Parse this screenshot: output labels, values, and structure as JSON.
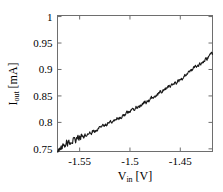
{
  "chart_data": {
    "type": "line",
    "title": "",
    "subtitle": "",
    "xlabel": "V_in [V]",
    "xlabel_base": "V",
    "xlabel_sub": "in",
    "xlabel_unit": "[V]",
    "ylabel": "I_out [mA]",
    "ylabel_base": "I",
    "ylabel_sub": "out",
    "ylabel_unit": "[mA]",
    "xlim": [
      -1.572,
      -1.418
    ],
    "ylim": [
      0.745,
      1.002
    ],
    "xticks": [
      -1.55,
      -1.5,
      -1.45
    ],
    "xtick_labels": [
      "-1.55",
      "-1.5",
      "-1.45"
    ],
    "yticks": [
      0.75,
      0.8,
      0.85,
      0.9,
      0.95,
      1
    ],
    "ytick_labels": [
      "0.75",
      "0.8",
      "0.85",
      "0.9",
      "0.95",
      "1"
    ],
    "grid": false,
    "legend": null,
    "line_color": "#1a1a1a",
    "line_width": 1.1,
    "axis_color": "#6e6e6e",
    "background": "#ffffff",
    "series": [
      {
        "name": "I_out vs V_in",
        "x": [
          -1.572,
          -1.571,
          -1.57,
          -1.569,
          -1.568,
          -1.567,
          -1.566,
          -1.565,
          -1.564,
          -1.563,
          -1.562,
          -1.561,
          -1.56,
          -1.559,
          -1.558,
          -1.557,
          -1.556,
          -1.555,
          -1.554,
          -1.553,
          -1.552,
          -1.551,
          -1.55,
          -1.549,
          -1.548,
          -1.547,
          -1.546,
          -1.545,
          -1.544,
          -1.543,
          -1.542,
          -1.541,
          -1.54,
          -1.539,
          -1.538,
          -1.537,
          -1.536,
          -1.535,
          -1.534,
          -1.533,
          -1.532,
          -1.531,
          -1.53,
          -1.529,
          -1.528,
          -1.527,
          -1.526,
          -1.525,
          -1.524,
          -1.523,
          -1.522,
          -1.521,
          -1.52,
          -1.519,
          -1.518,
          -1.517,
          -1.516,
          -1.515,
          -1.514,
          -1.513,
          -1.512,
          -1.511,
          -1.51,
          -1.509,
          -1.508,
          -1.507,
          -1.506,
          -1.505,
          -1.504,
          -1.503,
          -1.502,
          -1.501,
          -1.5,
          -1.499,
          -1.498,
          -1.497,
          -1.496,
          -1.495,
          -1.494,
          -1.493,
          -1.492,
          -1.491,
          -1.49,
          -1.489,
          -1.488,
          -1.487,
          -1.486,
          -1.485,
          -1.484,
          -1.483,
          -1.482,
          -1.481,
          -1.48,
          -1.479,
          -1.478,
          -1.477,
          -1.476,
          -1.475,
          -1.474,
          -1.473,
          -1.472,
          -1.471,
          -1.47,
          -1.469,
          -1.468,
          -1.467,
          -1.466,
          -1.465,
          -1.464,
          -1.463,
          -1.462,
          -1.461,
          -1.46,
          -1.459,
          -1.458,
          -1.457,
          -1.456,
          -1.455,
          -1.454,
          -1.453,
          -1.452,
          -1.451,
          -1.45,
          -1.449,
          -1.448,
          -1.447,
          -1.446,
          -1.445,
          -1.444,
          -1.443,
          -1.442,
          -1.441,
          -1.44,
          -1.439,
          -1.438,
          -1.437,
          -1.436,
          -1.435,
          -1.434,
          -1.433,
          -1.432,
          -1.431,
          -1.43,
          -1.429,
          -1.428,
          -1.427,
          -1.426,
          -1.425,
          -1.424,
          -1.423,
          -1.422,
          -1.421,
          -1.42,
          -1.419,
          -1.418
        ],
        "y": [
          0.749,
          0.752,
          0.7505,
          0.7545,
          0.753,
          0.7565,
          0.7555,
          0.758,
          0.757,
          0.76,
          0.759,
          0.7615,
          0.764,
          0.7625,
          0.765,
          0.7635,
          0.766,
          0.7675,
          0.766,
          0.7685,
          0.77,
          0.769,
          0.7715,
          0.7705,
          0.773,
          0.7745,
          0.7735,
          0.776,
          0.775,
          0.7775,
          0.779,
          0.778,
          0.78,
          0.7815,
          0.7805,
          0.7825,
          0.784,
          0.783,
          0.7855,
          0.787,
          0.786,
          0.7885,
          0.79,
          0.789,
          0.7915,
          0.793,
          0.792,
          0.7945,
          0.796,
          0.7955,
          0.7975,
          0.799,
          0.7985,
          0.8005,
          0.802,
          0.8015,
          0.8035,
          0.805,
          0.8045,
          0.807,
          0.8085,
          0.808,
          0.81,
          0.8115,
          0.811,
          0.8135,
          0.815,
          0.8145,
          0.8165,
          0.818,
          0.8175,
          0.82,
          0.8215,
          0.821,
          0.8235,
          0.825,
          0.8245,
          0.827,
          0.8285,
          0.828,
          0.8305,
          0.832,
          0.8315,
          0.834,
          0.8355,
          0.835,
          0.8375,
          0.839,
          0.8385,
          0.841,
          0.8425,
          0.842,
          0.8445,
          0.846,
          0.8455,
          0.848,
          0.85,
          0.8495,
          0.852,
          0.8535,
          0.853,
          0.8555,
          0.8575,
          0.857,
          0.8595,
          0.861,
          0.8605,
          0.863,
          0.865,
          0.8645,
          0.867,
          0.869,
          0.8685,
          0.871,
          0.873,
          0.8725,
          0.875,
          0.877,
          0.8765,
          0.879,
          0.881,
          0.8805,
          0.883,
          0.885,
          0.8845,
          0.8875,
          0.8895,
          0.889,
          0.8915,
          0.8935,
          0.893,
          0.896,
          0.898,
          0.8975,
          0.9,
          0.902,
          0.9015,
          0.9045,
          0.9065,
          0.906,
          0.909,
          0.911,
          0.9105,
          0.9135,
          0.9155,
          0.915,
          0.918,
          0.92,
          0.9195,
          0.9225,
          0.9245,
          0.924,
          0.927,
          0.929,
          0.9285
        ]
      }
    ],
    "noise_seed": 7,
    "noise_amplitude": 0.0035
  }
}
